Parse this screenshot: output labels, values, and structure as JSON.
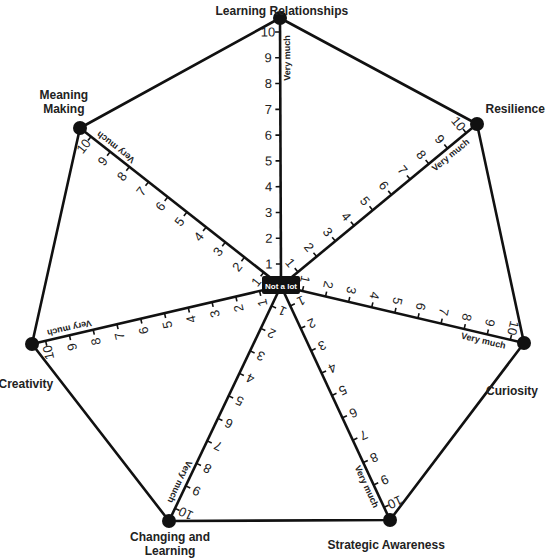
{
  "diagram": {
    "center": {
      "x": 281,
      "y": 286,
      "label": "Not a lot"
    },
    "scale": {
      "min": 1,
      "max": 10,
      "max_label": "Very much"
    },
    "colors": {
      "line": "#111111",
      "text": "#222222",
      "center_box": "#111111",
      "center_text": "#ffffff",
      "background": "#ffffff"
    },
    "axes": [
      {
        "name": "Learning Relationships",
        "x": 280,
        "y": 18,
        "label_x": 282,
        "label_y": 4,
        "label_lines": [
          "Learning Relationships"
        ]
      },
      {
        "name": "Resilience",
        "x": 477,
        "y": 124,
        "label_x": 515,
        "label_y": 102,
        "label_lines": [
          "Resilience"
        ]
      },
      {
        "name": "Curiosity",
        "x": 524,
        "y": 343,
        "label_x": 512,
        "label_y": 384,
        "label_lines": [
          "Curiosity"
        ]
      },
      {
        "name": "Strategic Awareness",
        "x": 390,
        "y": 520,
        "label_x": 386,
        "label_y": 538,
        "label_lines": [
          "Strategic Awareness"
        ]
      },
      {
        "name": "Changing and Learning",
        "x": 169,
        "y": 521,
        "label_x": 170,
        "label_y": 530,
        "label_lines": [
          "Changing and",
          "Learning"
        ]
      },
      {
        "name": "Creativity",
        "x": 32,
        "y": 344,
        "label_x": 26,
        "label_y": 377,
        "label_lines": [
          "Creativity"
        ]
      },
      {
        "name": "Meaning Making",
        "x": 80,
        "y": 128,
        "label_x": 64,
        "label_y": 88,
        "label_lines": [
          "Meaning",
          "Making"
        ]
      }
    ]
  }
}
